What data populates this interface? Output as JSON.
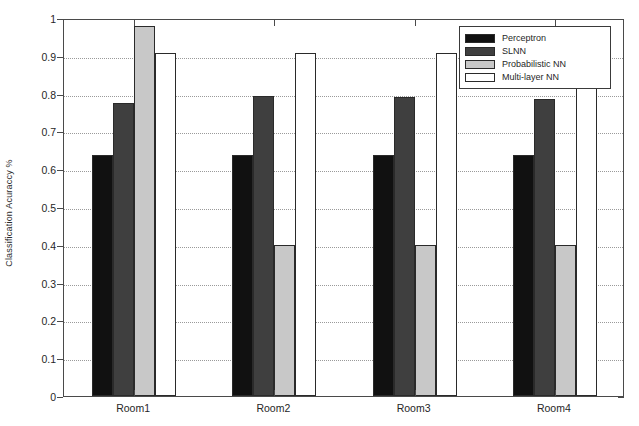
{
  "chart_data": {
    "type": "bar",
    "title": "",
    "xlabel": "",
    "ylabel": "Classification Acuraccy %",
    "categories": [
      "Room1",
      "Room2",
      "Room3",
      "Room4"
    ],
    "series": [
      {
        "name": "Perceptron",
        "color": "#111111",
        "values": [
          0.637,
          0.637,
          0.637,
          0.637
        ]
      },
      {
        "name": "SLNN",
        "color": "#3f3f3f",
        "values": [
          0.775,
          0.795,
          0.79,
          0.785
        ]
      },
      {
        "name": "Probabilistic NN",
        "color": "#c8c8c8",
        "values": [
          0.98,
          0.4,
          0.4,
          0.4
        ]
      },
      {
        "name": "Multi-layer NN",
        "color": "#ffffff",
        "values": [
          0.907,
          0.907,
          0.907,
          0.907
        ]
      }
    ],
    "ylim": [
      0,
      1
    ],
    "yticks": [
      0,
      0.1,
      0.2,
      0.3,
      0.4,
      0.5,
      0.6,
      0.7,
      0.8,
      0.9,
      1
    ],
    "ytick_labels": [
      "0",
      "0.1",
      "0.2",
      "0.3",
      "0.4",
      "0.5",
      "0.6",
      "0.7",
      "0.8",
      "0.9",
      "1"
    ],
    "grid": true,
    "grid_style": "dotted",
    "legend_position": "top-right",
    "axis_color": "#4a4a4a",
    "background": "#ffffff"
  },
  "legend": {
    "entries": [
      {
        "label": "Perceptron"
      },
      {
        "label": "SLNN"
      },
      {
        "label": "Probabilistic NN"
      },
      {
        "label": "Multi-layer NN"
      }
    ]
  }
}
